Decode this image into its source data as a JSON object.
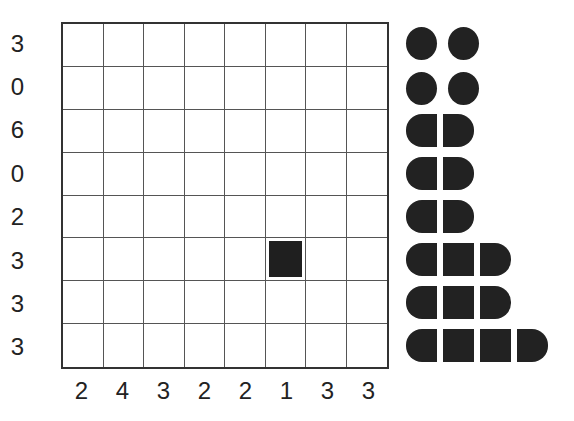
{
  "puzzle": {
    "type": "Battleships",
    "grid_size": 8,
    "row_clues": [
      "3",
      "0",
      "6",
      "0",
      "2",
      "3",
      "3",
      "3"
    ],
    "col_clues": [
      "2",
      "4",
      "3",
      "2",
      "2",
      "1",
      "3",
      "3"
    ],
    "given_cells": [
      {
        "row": 6,
        "col": 6,
        "type": "ship-middle"
      }
    ]
  },
  "fleet": [
    {
      "name": "submarine-1",
      "length": 1
    },
    {
      "name": "submarine-2",
      "length": 1
    },
    {
      "name": "submarine-3",
      "length": 1
    },
    {
      "name": "submarine-4",
      "length": 1
    },
    {
      "name": "destroyer-1",
      "length": 2
    },
    {
      "name": "destroyer-2",
      "length": 2
    },
    {
      "name": "destroyer-3",
      "length": 2
    },
    {
      "name": "cruiser-1",
      "length": 3
    },
    {
      "name": "cruiser-2",
      "length": 3
    },
    {
      "name": "battleship",
      "length": 4
    }
  ],
  "colors": {
    "ship": "#222222",
    "grid_line": "#555555",
    "border": "#333333",
    "background": "#ffffff"
  }
}
